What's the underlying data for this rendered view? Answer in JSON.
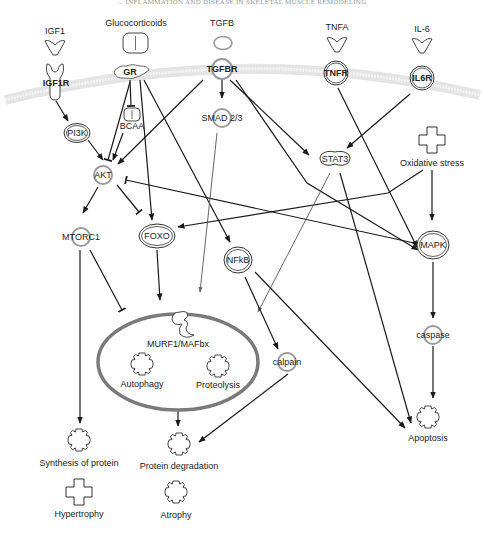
{
  "header": {
    "title": "... INFLAMMATION AND DISEASE IN SKELETAL MUSCLE REMODELING"
  },
  "ligands": {
    "igf1": "IGF1",
    "glucocorticoids": "Glucocorticoids",
    "tgfb": "TGFB",
    "tnfa": "TNFA",
    "il6": "IL-6"
  },
  "receptors": {
    "igf1r": "IGF1R",
    "gr": "GR",
    "tgfbr": "TGFBR",
    "tnfr": "TNFR",
    "il6r": "IL6R"
  },
  "nodes": {
    "bcaa": "BCAA",
    "pi3k": "PI3K",
    "smad": "SMAD 2/3",
    "akt": "AKT",
    "stat3": "STAT3",
    "oxidative_stress": "Oxidative stress",
    "mtorc1": "MTORC1",
    "foxo": "FOXO",
    "nfkb": "NFkB",
    "mapk": "MAPK",
    "caspase": "caspase",
    "calpain": "calpain",
    "murf": "MURF1/MAFbx",
    "autophagy": "Autophagy",
    "proteolysis": "Proteolysis",
    "apoptosis": "Apoptosis",
    "synthesis": "Synthesis of protein",
    "degradation": "Protein degradation",
    "hypertrophy": "Hypertrophy",
    "atrophy": "Atrophy"
  },
  "colors": {
    "edge": "#1a1a1a",
    "ring": "#9a9a9a",
    "membrane": "#e6e6e6",
    "proteasome_ellipse": "#7a7a7a"
  }
}
